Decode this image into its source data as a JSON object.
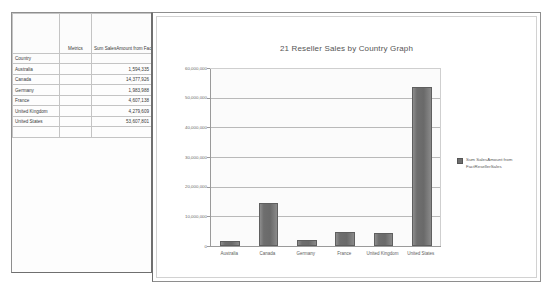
{
  "table": {
    "column_headers": {
      "blank": "",
      "metrics": "Metrics",
      "measure": "Sum SalesAmount from FactResellerSales"
    },
    "row_group_header": "Country",
    "rows": [
      {
        "country": "Australia",
        "value": "1,594,335"
      },
      {
        "country": "Canada",
        "value": "14,377,926"
      },
      {
        "country": "Germany",
        "value": "1,983,988"
      },
      {
        "country": "France",
        "value": "4,607,138"
      },
      {
        "country": "United Kingdom",
        "value": "4,279,609"
      },
      {
        "country": "United States",
        "value": "53,607,801"
      }
    ]
  },
  "chart": {
    "title": "21 Reseller Sales by Country Graph",
    "legend_label": "Sum SalesAmount from FactResellerSales"
  },
  "chart_data": {
    "type": "bar",
    "title": "21 Reseller Sales by Country Graph",
    "xlabel": "",
    "ylabel": "",
    "categories": [
      "Australia",
      "Canada",
      "Germany",
      "France",
      "United Kingdom",
      "United States"
    ],
    "values": [
      1594335,
      14377926,
      1983988,
      4607138,
      4279609,
      53607801
    ],
    "series": [
      {
        "name": "Sum SalesAmount from FactResellerSales",
        "values": [
          1594335,
          14377926,
          1983988,
          4607138,
          4279609,
          53607801
        ]
      }
    ],
    "ylim": [
      0,
      60000000
    ],
    "ytick_values": [
      0,
      10000000,
      20000000,
      30000000,
      40000000,
      50000000,
      60000000
    ],
    "ytick_labels": [
      "0",
      "10,000,000",
      "20,000,000",
      "30,000,000",
      "40,000,000",
      "50,000,000",
      "60,000,000"
    ],
    "grid": true,
    "legend_position": "right",
    "bar_color": "#6e6e6e"
  }
}
